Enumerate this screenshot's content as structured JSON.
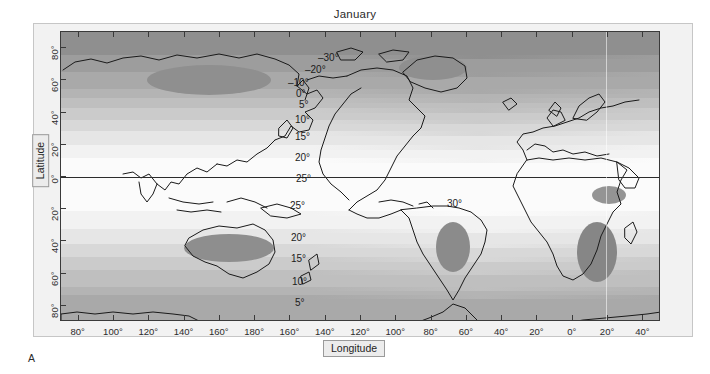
{
  "figure": {
    "title": "January",
    "panel_letter": "A",
    "quantity": "Mean monthly temperature (degrees Celsius)",
    "projection": "cylindrical-equidistant"
  },
  "axes": {
    "x": {
      "title": "Longitude",
      "tick_labels": [
        "80°",
        "100°",
        "120°",
        "140°",
        "160°",
        "180°",
        "160°",
        "140°",
        "120°",
        "100°",
        "80°",
        "60°",
        "40°",
        "20°",
        "0°",
        "20°",
        "40°"
      ],
      "tick_values": [
        80,
        100,
        120,
        140,
        160,
        180,
        -160,
        -140,
        -120,
        -100,
        -80,
        -60,
        -40,
        -20,
        0,
        20,
        40
      ],
      "range": [
        70,
        50
      ]
    },
    "y": {
      "title": "Latitude",
      "tick_labels": [
        "80°",
        "60°",
        "40°",
        "20°",
        "0°",
        "20°",
        "40°",
        "60°",
        "80°"
      ],
      "tick_values": [
        80,
        60,
        40,
        20,
        0,
        -20,
        -40,
        -60,
        -80
      ],
      "range": [
        90,
        -90
      ]
    }
  },
  "contour_labels": [
    {
      "text": "–30°",
      "x": 318,
      "y": 52
    },
    {
      "text": "–20°",
      "x": 305,
      "y": 64
    },
    {
      "text": "–10°",
      "x": 288,
      "y": 77
    },
    {
      "text": "0°",
      "x": 296,
      "y": 88
    },
    {
      "text": "5°",
      "x": 299,
      "y": 99
    },
    {
      "text": "10°",
      "x": 295,
      "y": 114
    },
    {
      "text": "15°",
      "x": 295,
      "y": 131
    },
    {
      "text": "20°",
      "x": 295,
      "y": 152
    },
    {
      "text": "25°",
      "x": 296,
      "y": 173
    },
    {
      "text": "25°",
      "x": 290,
      "y": 200
    },
    {
      "text": "20°",
      "x": 291,
      "y": 232
    },
    {
      "text": "15°",
      "x": 291,
      "y": 253
    },
    {
      "text": "10°",
      "x": 292,
      "y": 276
    },
    {
      "text": "5°",
      "x": 295,
      "y": 297
    },
    {
      "text": "30°",
      "x": 447,
      "y": 198
    }
  ],
  "chart_data": {
    "type": "heatmap",
    "title": "January",
    "xlabel": "Longitude",
    "ylabel": "Latitude",
    "zlabel": "Mean temperature (°C)",
    "xlim": [
      70,
      50
    ],
    "ylim": [
      -90,
      90
    ],
    "grid": false,
    "legend": "none",
    "contour_levels": [
      -30,
      -20,
      -10,
      0,
      5,
      10,
      15,
      20,
      25,
      30
    ],
    "zonal_profile": [
      {
        "lat": 88,
        "temp": -32
      },
      {
        "lat": 80,
        "temp": -28
      },
      {
        "lat": 72,
        "temp": -22
      },
      {
        "lat": 65,
        "temp": -15
      },
      {
        "lat": 58,
        "temp": -8
      },
      {
        "lat": 50,
        "temp": -1
      },
      {
        "lat": 44,
        "temp": 4
      },
      {
        "lat": 37,
        "temp": 9
      },
      {
        "lat": 30,
        "temp": 14
      },
      {
        "lat": 22,
        "temp": 19
      },
      {
        "lat": 12,
        "temp": 24
      },
      {
        "lat": 2,
        "temp": 26
      },
      {
        "lat": -8,
        "temp": 26
      },
      {
        "lat": -18,
        "temp": 25
      },
      {
        "lat": -28,
        "temp": 22
      },
      {
        "lat": -38,
        "temp": 17
      },
      {
        "lat": -48,
        "temp": 11
      },
      {
        "lat": -58,
        "temp": 5
      },
      {
        "lat": -68,
        "temp": 0
      },
      {
        "lat": -80,
        "temp": -12
      }
    ],
    "hot_centres": [
      {
        "name": "Interior Australia",
        "label": "30°",
        "lon": 132,
        "lat": -24
      },
      {
        "name": "Central South America",
        "label": "30°",
        "lon": -58,
        "lat": -14
      },
      {
        "name": "Southern Africa",
        "label": "30°",
        "lon": 23,
        "lat": -22
      },
      {
        "name": "Ethiopia / Horn of Africa",
        "label": "30°",
        "lon": 40,
        "lat": 7
      }
    ],
    "cold_centres": [
      {
        "name": "Eastern Siberia",
        "label": "–30°",
        "lon": 115,
        "lat": 66
      },
      {
        "name": "Greenland",
        "label": "–30°",
        "lon": -42,
        "lat": 74
      },
      {
        "name": "Antarctica",
        "label": "–30°",
        "lon": 0,
        "lat": -85
      }
    ]
  },
  "colors": {
    "page_background": "#ffffff",
    "panel_background": "#f2f2f2",
    "frame_stroke": "#3a3a3a",
    "coastline": "#1a1a1a",
    "text": "#2b2b2b",
    "band_coldest": "#9d9d9d",
    "band_cold": "#b4b4b4",
    "band_cool": "#c6c6c6",
    "band_mild": "#d8d8d8",
    "band_warm": "#e9e9e9",
    "band_warmest": "#fafafa",
    "hot_core": "#8a8a8a"
  }
}
